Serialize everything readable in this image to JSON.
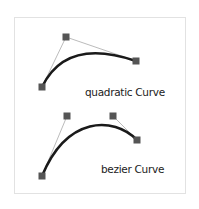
{
  "frame": {
    "x": 14,
    "y": 17,
    "w": 171,
    "h": 176,
    "border_color": "#e2e2e2"
  },
  "colors": {
    "curve": "#1a1a1a",
    "guide": "#aaaaaa",
    "handle": "#555555"
  },
  "quadratic": {
    "label": "quadratic Curve",
    "start": [
      42,
      87
    ],
    "control": [
      66,
      37
    ],
    "end": [
      136,
      61
    ],
    "label_pos": [
      85,
      96
    ]
  },
  "bezier": {
    "label": "bezier Curve",
    "start": [
      42,
      176
    ],
    "control1": [
      67,
      116
    ],
    "control2": [
      113,
      116
    ],
    "end": [
      137,
      140
    ],
    "label_pos": [
      101,
      173
    ]
  }
}
